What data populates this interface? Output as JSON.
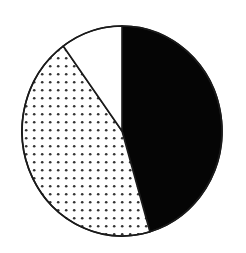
{
  "figure": {
    "type": "pie-chart-figure",
    "background_color": "#ffffff",
    "width": 246,
    "height": 253,
    "title": "",
    "caption": ""
  },
  "chart_data": {
    "type": "pie",
    "title": "",
    "subtitle": "",
    "xlabel": "",
    "ylabel": "",
    "legend_position": "none",
    "grid": false,
    "start_angle_deg": 0,
    "direction": "clockwise",
    "center": {
      "x": 122,
      "y": 131
    },
    "radius_x": 100,
    "radius_y": 105,
    "labels": [
      "Black sector",
      "Dotted sector",
      "White sector"
    ],
    "values": [
      45.5,
      44.5,
      10.0
    ],
    "angles_deg": [
      163.8,
      160.2,
      36.0
    ],
    "fills": [
      "solid-black",
      "dotted-stipple",
      "solid-white"
    ],
    "colors": [
      "#050505",
      "#ffffff",
      "#ffffff"
    ],
    "outline_color": "#1a1a1a",
    "series": [
      {
        "name": "Proportions",
        "values": [
          45.5,
          44.5,
          10.0
        ]
      }
    ],
    "annotations": []
  },
  "pattern": {
    "name": "dot-stipple",
    "dot_color": "#333333",
    "dot_radius": 1.3,
    "spacing": 8
  },
  "geometry": {
    "boundary_1_label": "white-black-boundary-top",
    "boundary_1_angle_deg": 0,
    "boundary_2_label": "black-dotted-boundary-lower-right",
    "boundary_2_angle_deg": 163.8,
    "boundary_3_label": "dotted-white-boundary-upper-left",
    "boundary_3_angle_deg": 324.0
  }
}
